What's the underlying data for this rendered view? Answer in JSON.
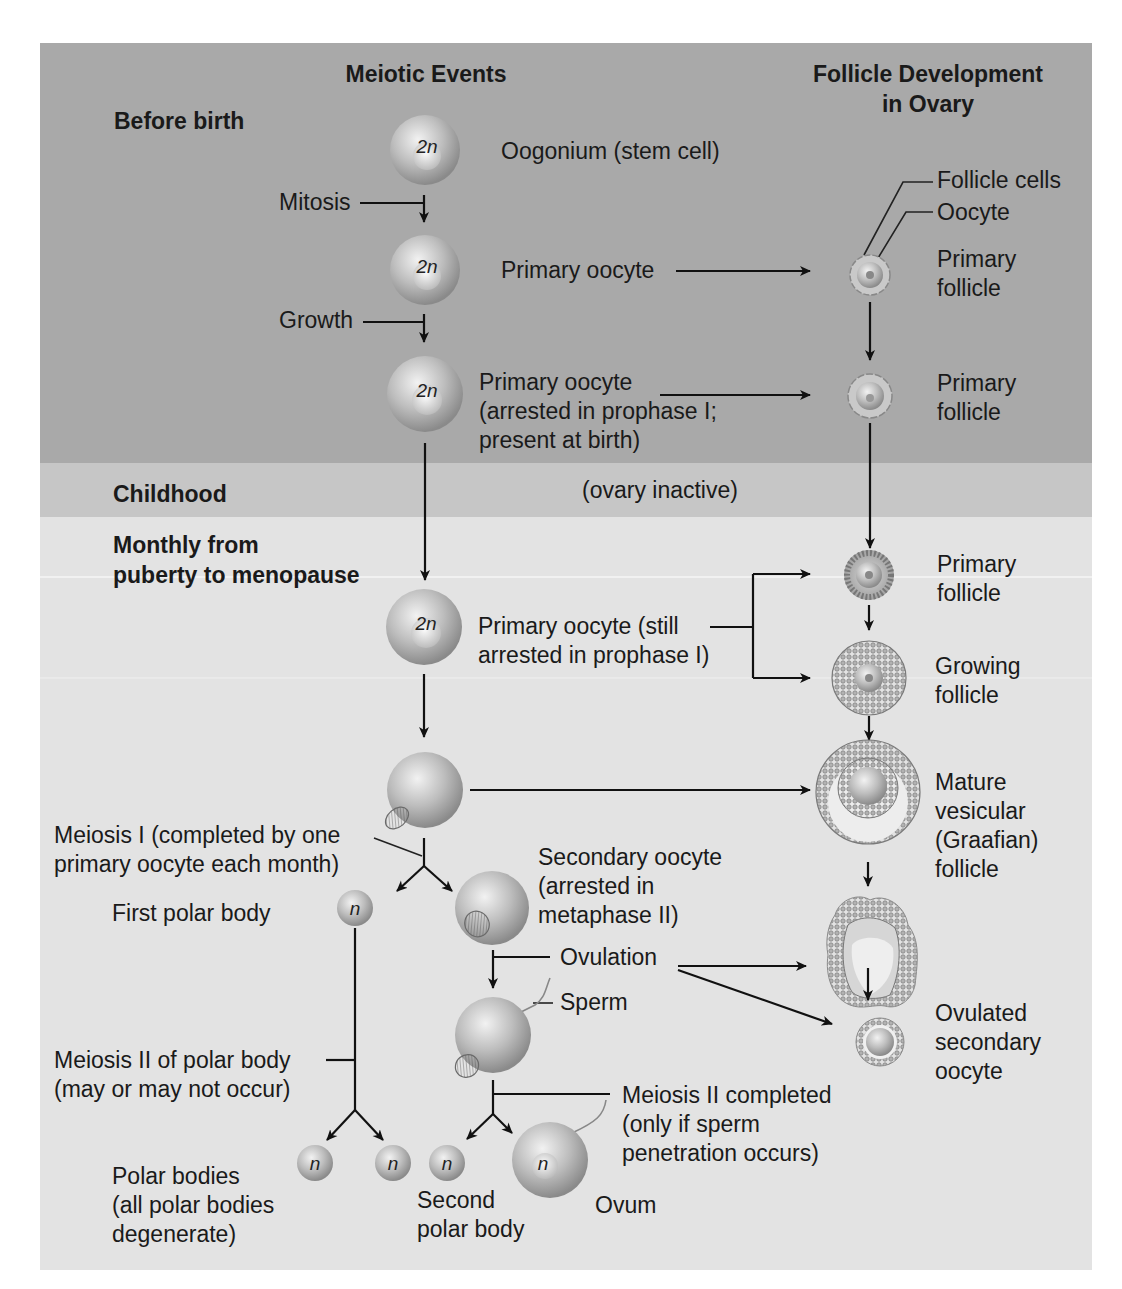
{
  "figure": {
    "colors": {
      "band_before_birth": "#a9a9a9",
      "band_childhood": "#c6c6c6",
      "band_puberty": "#e3e3e3",
      "text": "#1a1a1a",
      "arrow": "#111111"
    },
    "columns": {
      "meiotic_events": "Meiotic Events",
      "follicle_line1": "Follicle Development",
      "follicle_line2": "in Ovary"
    },
    "stages": {
      "before_birth": "Before birth",
      "childhood": "Childhood",
      "puberty_line1": "Monthly from",
      "puberty_line2": "puberty to menopause"
    },
    "cells": {
      "diploid": "2n",
      "haploid": "n"
    },
    "meiotic": {
      "oogonium": "Oogonium (stem cell)",
      "mitosis": "Mitosis",
      "primary_oocyte": "Primary oocyte",
      "growth": "Growth",
      "arrested_line1": "Primary oocyte",
      "arrested_line2": "(arrested in prophase I;",
      "arrested_line3": "present at birth)",
      "ovary_inactive": "(ovary inactive)",
      "still_arrested_line1": "Primary oocyte (still",
      "still_arrested_line2": "arrested in prophase I)",
      "meiosis1_line1": "Meiosis I (completed by one",
      "meiosis1_line2": "primary oocyte each month)",
      "first_polar_body": "First polar body",
      "secondary_line1": "Secondary oocyte",
      "secondary_line2": "(arrested in",
      "secondary_line3": "metaphase II)",
      "ovulation": "Ovulation",
      "sperm": "Sperm",
      "meiosis2_polar_line1": "Meiosis II of polar body",
      "meiosis2_polar_line2": "(may or may not occur)",
      "meiosis2_completed_line1": "Meiosis II completed",
      "meiosis2_completed_line2": "(only if sperm",
      "meiosis2_completed_line3": "penetration occurs)",
      "polar_bodies_line1": "Polar bodies",
      "polar_bodies_line2": "(all polar bodies",
      "polar_bodies_line3": "degenerate)",
      "second_polar_line1": "Second",
      "second_polar_line2": "polar body",
      "ovum": "Ovum"
    },
    "follicle": {
      "follicle_cells": "Follicle cells",
      "oocyte": "Oocyte",
      "primary_1_line1": "Primary",
      "primary_1_line2": "follicle",
      "primary_2_line1": "Primary",
      "primary_2_line2": "follicle",
      "primary_3_line1": "Primary",
      "primary_3_line2": "follicle",
      "growing_line1": "Growing",
      "growing_line2": "follicle",
      "mature_line1": "Mature",
      "mature_line2": "vesicular",
      "mature_line3": "(Graafian)",
      "mature_line4": "follicle",
      "ovulated_line1": "Ovulated",
      "ovulated_line2": "secondary",
      "ovulated_line3": "oocyte"
    }
  }
}
